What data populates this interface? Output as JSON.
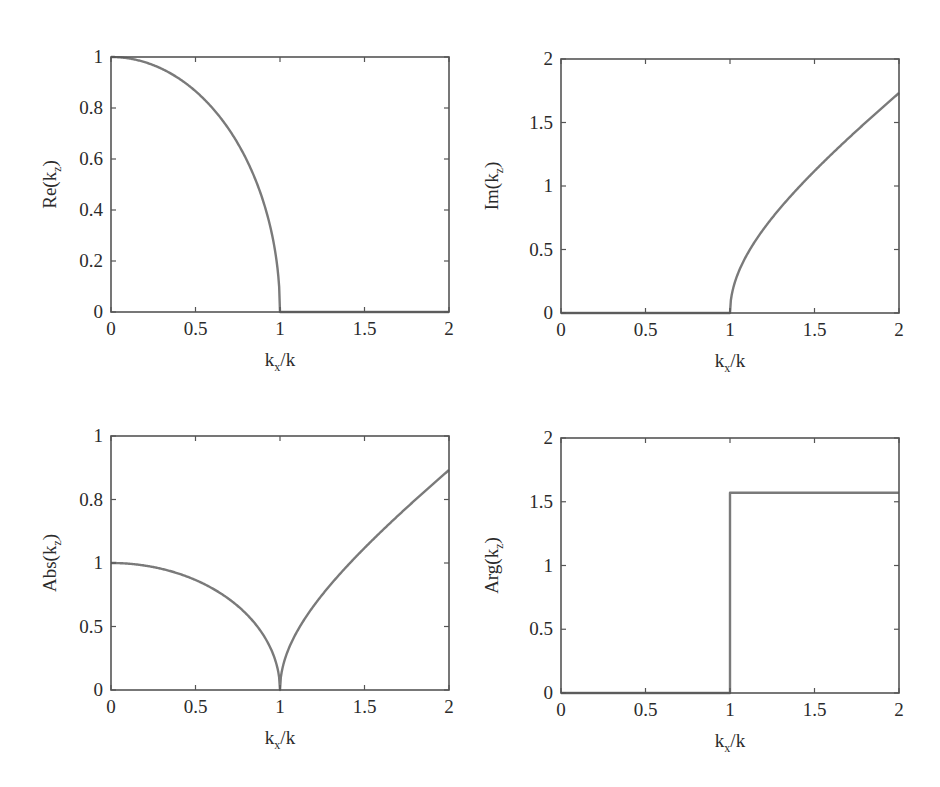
{
  "figure": {
    "panels": [
      {
        "id": "re",
        "ylabel_main": "Re(k",
        "ylabel_sub": "z",
        "ylabel_close": ")",
        "xlabel_main": "k",
        "xlabel_sub": "x",
        "xlabel_rest": "/k",
        "frame": {
          "x0": 111,
          "y0": 57,
          "x1": 449,
          "y1": 312
        },
        "xlim": [
          0,
          2
        ],
        "ylim": [
          0,
          1
        ],
        "xticks": [
          0,
          0.5,
          1,
          1.5,
          2
        ],
        "xticklabels": [
          "0",
          "0.5",
          "1",
          "1.5",
          "2"
        ],
        "yticks": [
          0,
          0.2,
          0.4,
          0.6,
          0.8,
          1
        ],
        "yticklabels": [
          "0",
          "0.2",
          "0.4",
          "0.6",
          "0.8",
          "1"
        ]
      },
      {
        "id": "im",
        "ylabel_main": "Im(k",
        "ylabel_sub": "z",
        "ylabel_close": ")",
        "xlabel_main": "k",
        "xlabel_sub": "x",
        "xlabel_rest": "/k",
        "frame": {
          "x0": 561,
          "y0": 59,
          "x1": 899,
          "y1": 313
        },
        "xlim": [
          0,
          2
        ],
        "ylim": [
          0,
          2
        ],
        "xticks": [
          0,
          0.5,
          1,
          1.5,
          2
        ],
        "xticklabels": [
          "0",
          "0.5",
          "1",
          "1.5",
          "2"
        ],
        "yticks": [
          0,
          0.5,
          1,
          1.5,
          2
        ],
        "yticklabels": [
          "0",
          "0.5",
          "1",
          "1.5",
          "2"
        ]
      },
      {
        "id": "abs",
        "ylabel_main": "Abs(k",
        "ylabel_sub": "z",
        "ylabel_close": ")",
        "xlabel_main": "k",
        "xlabel_sub": "x",
        "xlabel_rest": "/k",
        "frame": {
          "x0": 111,
          "y0": 436,
          "x1": 449,
          "y1": 690
        },
        "xlim": [
          0,
          2
        ],
        "ylim": [
          0,
          2
        ],
        "xticks": [
          0,
          0.5,
          1,
          1.5,
          2
        ],
        "xticklabels": [
          "0",
          "0.5",
          "1",
          "1.5",
          "2"
        ],
        "yticks": [
          0,
          0.5,
          1,
          1.5,
          2
        ],
        "yticklabels": [
          "0",
          "0.5",
          "1",
          "0.8",
          "1"
        ]
      },
      {
        "id": "arg",
        "ylabel_main": "Arg(k",
        "ylabel_sub": "z",
        "ylabel_close": ")",
        "xlabel_main": "k",
        "xlabel_sub": "x",
        "xlabel_rest": "/k",
        "frame": {
          "x0": 561,
          "y0": 438,
          "x1": 899,
          "y1": 693
        },
        "xlim": [
          0,
          2
        ],
        "ylim": [
          0,
          2
        ],
        "xticks": [
          0,
          0.5,
          1,
          1.5,
          2
        ],
        "xticklabels": [
          "0",
          "0.5",
          "1",
          "1.5",
          "2"
        ],
        "yticks": [
          0,
          0.5,
          1,
          1.5,
          2
        ],
        "yticklabels": [
          "0",
          "0.5",
          "1",
          "1.5",
          "2"
        ]
      }
    ],
    "colors": {
      "curve": "#7a7a7a",
      "axes": "#555555",
      "text": "#2b2b2b",
      "background": "#ffffff"
    }
  },
  "chart_data": [
    {
      "type": "line",
      "title": "",
      "xlabel": "k_x/k",
      "ylabel": "Re(k_z)",
      "xlim": [
        0,
        2
      ],
      "ylim": [
        0,
        1
      ],
      "grid": false,
      "x": [
        0,
        0.1,
        0.2,
        0.3,
        0.4,
        0.5,
        0.6,
        0.7,
        0.8,
        0.9,
        0.95,
        0.99,
        1.0,
        1.25,
        1.5,
        1.75,
        2.0
      ],
      "series": [
        {
          "name": "Re(k_z)",
          "values": [
            1.0,
            0.995,
            0.98,
            0.954,
            0.917,
            0.866,
            0.8,
            0.714,
            0.6,
            0.436,
            0.312,
            0.141,
            0.0,
            0.0,
            0.0,
            0.0,
            0.0
          ]
        }
      ]
    },
    {
      "type": "line",
      "title": "",
      "xlabel": "k_x/k",
      "ylabel": "Im(k_z)",
      "xlim": [
        0,
        2
      ],
      "ylim": [
        0,
        2
      ],
      "grid": false,
      "x": [
        0,
        0.5,
        1.0,
        1.01,
        1.05,
        1.1,
        1.2,
        1.3,
        1.4,
        1.5,
        1.6,
        1.7,
        1.8,
        1.9,
        2.0
      ],
      "series": [
        {
          "name": "Im(k_z)",
          "values": [
            0.0,
            0.0,
            0.0,
            0.142,
            0.32,
            0.458,
            0.663,
            0.831,
            0.98,
            1.118,
            1.249,
            1.375,
            1.497,
            1.616,
            1.732
          ]
        }
      ]
    },
    {
      "type": "line",
      "title": "",
      "xlabel": "k_x/k",
      "ylabel": "Abs(k_z)",
      "xlim": [
        0,
        2
      ],
      "ylim": [
        0,
        2
      ],
      "grid": false,
      "ytick_labels_as_shown": [
        "0",
        "0.5",
        "1",
        "0.8",
        "1"
      ],
      "x": [
        0,
        0.2,
        0.4,
        0.5,
        0.6,
        0.7,
        0.8,
        0.9,
        0.95,
        1.0,
        1.05,
        1.1,
        1.2,
        1.4,
        1.6,
        1.8,
        2.0
      ],
      "series": [
        {
          "name": "Abs(k_z)",
          "values": [
            1.0,
            0.98,
            0.917,
            0.866,
            0.8,
            0.714,
            0.6,
            0.436,
            0.312,
            0.0,
            0.32,
            0.458,
            0.663,
            0.98,
            1.249,
            1.497,
            1.732
          ]
        }
      ]
    },
    {
      "type": "line",
      "title": "",
      "xlabel": "k_x/k",
      "ylabel": "Arg(k_z)",
      "xlim": [
        0,
        2
      ],
      "ylim": [
        0,
        2
      ],
      "grid": false,
      "x": [
        0,
        0.5,
        1.0,
        1.0,
        1.5,
        2.0
      ],
      "series": [
        {
          "name": "Arg(k_z)",
          "values": [
            0.0,
            0.0,
            0.0,
            1.5708,
            1.5708,
            1.5708
          ]
        }
      ]
    }
  ]
}
